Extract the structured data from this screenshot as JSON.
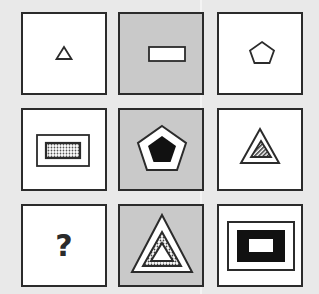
{
  "puzzle": {
    "type": "3x3 matrix reasoning",
    "colors": {
      "background": "#e9e9e9",
      "cell_white": "#ffffff",
      "cell_gray": "#c9c9c9",
      "stroke": "#2b2b2b"
    },
    "cells": [
      {
        "row": 1,
        "col": 1,
        "bg": "white",
        "shape": "triangle",
        "layers": 1
      },
      {
        "row": 1,
        "col": 2,
        "bg": "gray",
        "shape": "rectangle",
        "layers": 1
      },
      {
        "row": 1,
        "col": 3,
        "bg": "white",
        "shape": "pentagon",
        "layers": 1
      },
      {
        "row": 2,
        "col": 1,
        "bg": "white",
        "shape": "rectangle",
        "layers": 2,
        "inner_fill": "dotted"
      },
      {
        "row": 2,
        "col": 2,
        "bg": "gray",
        "shape": "pentagon",
        "layers": 2,
        "inner_fill": "black"
      },
      {
        "row": 2,
        "col": 3,
        "bg": "white",
        "shape": "triangle",
        "layers": 2,
        "inner_fill": "hatched"
      },
      {
        "row": 3,
        "col": 1,
        "bg": "white",
        "shape": "unknown",
        "label": "?"
      },
      {
        "row": 3,
        "col": 2,
        "bg": "gray",
        "shape": "triangle",
        "layers": 3,
        "inner_fill": "dotted-band"
      },
      {
        "row": 3,
        "col": 3,
        "bg": "white",
        "shape": "rectangle",
        "layers": 3,
        "inner_fill": "black-band"
      }
    ],
    "question_mark": "?"
  }
}
